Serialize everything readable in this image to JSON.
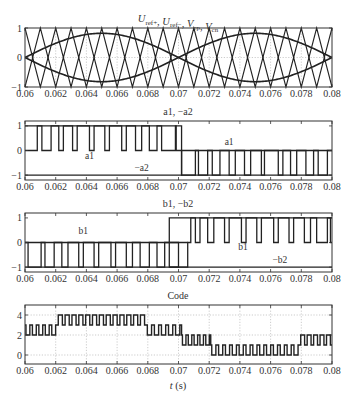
{
  "figure": {
    "xlabel": "t (s)",
    "x_ticks": [
      "0.06",
      "0.062",
      "0.064",
      "0.066",
      "0.068",
      "0.07",
      "0.072",
      "0.074",
      "0.076",
      "0.078",
      "0.08"
    ]
  },
  "chart_data": [
    {
      "type": "line",
      "title": "Uref+, Uref−, Vcp, Vcn",
      "title_parts": [
        {
          "t": "U",
          "s": "ref+"
        },
        {
          "t": ", "
        },
        {
          "t": "U",
          "s": "ref−"
        },
        {
          "t": ", "
        },
        {
          "t": "V",
          "s": "cp"
        },
        {
          "t": ", "
        },
        {
          "t": "V",
          "s": "cn"
        }
      ],
      "xlim": [
        0.06,
        0.08
      ],
      "ylim": [
        -1,
        1
      ],
      "y_ticks": [
        1,
        0,
        -1
      ],
      "x_ticks": [
        0.06,
        0.062,
        0.064,
        0.066,
        0.068,
        0.07,
        0.072,
        0.074,
        0.076,
        0.078,
        0.08
      ],
      "grid": true,
      "series": [
        {
          "name": "Uref+",
          "kind": "sine",
          "amplitude": 0.82,
          "frequency_hz": 50,
          "phase": 0
        },
        {
          "name": "Uref−",
          "kind": "sine",
          "amplitude": -0.82,
          "frequency_hz": 50,
          "phase": 0
        },
        {
          "name": "Vcp",
          "kind": "triangle",
          "min": 0,
          "max": 1,
          "periods": 20
        },
        {
          "name": "Vcn",
          "kind": "triangle",
          "min": -1,
          "max": 0,
          "periods": 20
        }
      ]
    },
    {
      "type": "line",
      "title": "a1, −a2",
      "xlim": [
        0.06,
        0.08
      ],
      "ylim": [
        -1.2,
        1.2
      ],
      "y_ticks": [
        1,
        0,
        -1
      ],
      "x_ticks": [
        0.06,
        0.062,
        0.064,
        0.066,
        0.068,
        0.07,
        0.072,
        0.074,
        0.076,
        0.078,
        0.08
      ],
      "grid": false,
      "annotations": [
        {
          "text": "a1",
          "x": 0.0642,
          "y": -0.35
        },
        {
          "text": "−a2",
          "x": 0.0676,
          "y": -0.82
        },
        {
          "text": "a1",
          "x": 0.0733,
          "y": 0.22
        }
      ],
      "series": [
        {
          "name": "a1",
          "pulses": [
            [
              0.0608,
              0.0611
            ],
            [
              0.0617,
              0.0622
            ],
            [
              0.0625,
              0.0631
            ],
            [
              0.0634,
              0.0642
            ],
            [
              0.0645,
              0.0652
            ],
            [
              0.0655,
              0.0663
            ],
            [
              0.0666,
              0.0672
            ],
            [
              0.0676,
              0.0681
            ],
            [
              0.0686,
              0.0689
            ],
            [
              0.0698,
              0.06985
            ]
          ],
          "high": 1,
          "low": 0,
          "until": 0.0702
        },
        {
          "name": "−a2",
          "pulses_low": [
            [
              0.0702,
              0.0711
            ],
            [
              0.0713,
              0.0719
            ],
            [
              0.0722,
              0.0727
            ],
            [
              0.0733,
              0.0737
            ],
            [
              0.0743,
              0.0747
            ],
            [
              0.0754,
              0.0756
            ],
            [
              0.0765,
              0.0768
            ],
            [
              0.0773,
              0.0777
            ],
            [
              0.0783,
              0.0788
            ],
            [
              0.0791,
              0.0797
            ]
          ],
          "high": 0,
          "low": -1,
          "from": 0.0702
        }
      ]
    },
    {
      "type": "line",
      "title": "b1, −b2",
      "xlim": [
        0.06,
        0.08
      ],
      "ylim": [
        -1.2,
        1.2
      ],
      "y_ticks": [
        1,
        0,
        -1
      ],
      "x_ticks": [
        0.06,
        0.062,
        0.064,
        0.066,
        0.068,
        0.07,
        0.072,
        0.074,
        0.076,
        0.078,
        0.08
      ],
      "grid": false,
      "annotations": [
        {
          "text": "b1",
          "x": 0.0638,
          "y": 0.35
        },
        {
          "text": "b1",
          "x": 0.0742,
          "y": -0.32
        },
        {
          "text": "−b2",
          "x": 0.0766,
          "y": -0.82
        }
      ],
      "series": [
        {
          "name": "−b2",
          "pulses_low": [
            [
              0.0602,
              0.06105
            ],
            [
              0.0613,
              0.0619
            ],
            [
              0.0624,
              0.0628
            ],
            [
              0.0635,
              0.0638
            ],
            [
              0.0645,
              0.0648
            ],
            [
              0.0656,
              0.0659
            ],
            [
              0.0666,
              0.067
            ],
            [
              0.0675,
              0.0681
            ],
            [
              0.0686,
              0.0691
            ],
            [
              0.0694,
              0.07
            ]
          ],
          "high": 0,
          "low": -1,
          "until": 0.0694
        },
        {
          "name": "b1",
          "pulses": [
            [
              0.0708,
              0.0711
            ],
            [
              0.0714,
              0.0719
            ],
            [
              0.0723,
              0.073
            ],
            [
              0.0733,
              0.0741
            ],
            [
              0.0744,
              0.0751
            ],
            [
              0.0754,
              0.0762
            ],
            [
              0.0765,
              0.0772
            ],
            [
              0.0775,
              0.0782
            ],
            [
              0.0786,
              0.079
            ],
            [
              0.0797,
              0.0799
            ]
          ],
          "high": 1,
          "low": 0,
          "from": 0.0706
        }
      ]
    },
    {
      "type": "line",
      "title": "Code",
      "xlim": [
        0.06,
        0.08
      ],
      "ylim": [
        -0.9,
        5
      ],
      "y_ticks": [
        4,
        2,
        0
      ],
      "x_ticks": [
        0.06,
        0.062,
        0.064,
        0.066,
        0.068,
        0.07,
        0.072,
        0.074,
        0.076,
        0.078,
        0.08
      ],
      "grid": true,
      "series": [
        {
          "name": "Code",
          "segments": [
            {
              "from": 0.06,
              "to": 0.0621,
              "base": 3,
              "alt": 2,
              "pulses": 5
            },
            {
              "from": 0.0621,
              "to": 0.0679,
              "base": 3,
              "alt": 4,
              "pulses": 13
            },
            {
              "from": 0.0679,
              "to": 0.0702,
              "base": 3,
              "alt": 2,
              "pulses": 5
            },
            {
              "from": 0.0702,
              "to": 0.0721,
              "base": 2,
              "alt": 1,
              "pulses": 5
            },
            {
              "from": 0.0721,
              "to": 0.0779,
              "base": 1,
              "alt": 0,
              "pulses": 13
            },
            {
              "from": 0.0779,
              "to": 0.08,
              "base": 1,
              "alt": 2,
              "pulses": 5
            }
          ]
        }
      ]
    }
  ]
}
